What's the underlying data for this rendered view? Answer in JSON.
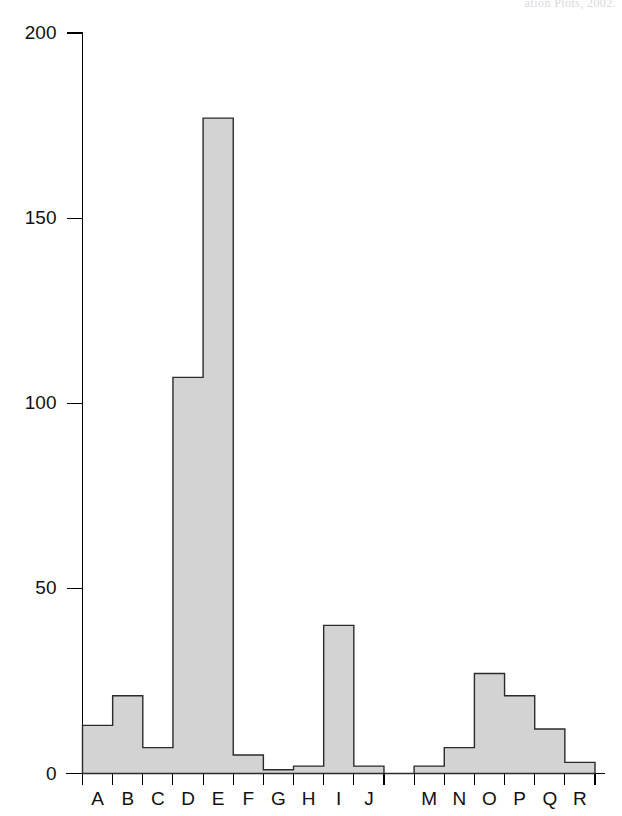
{
  "page": {
    "header_fragment": "ation Plots, 2002."
  },
  "chart_data": {
    "type": "bar",
    "title": "",
    "subtitle": "",
    "xlabel": "",
    "ylabel": "",
    "categories": [
      "A",
      "B",
      "C",
      "D",
      "E",
      "F",
      "G",
      "H",
      "I",
      "J",
      "",
      "M",
      "N",
      "O",
      "P",
      "Q",
      "R"
    ],
    "values": [
      13,
      21,
      7,
      107,
      177,
      5,
      1,
      2,
      40,
      2,
      0,
      2,
      7,
      27,
      21,
      12,
      3
    ],
    "ylim": [
      0,
      200
    ],
    "yticks": [
      0,
      50,
      100,
      150,
      200
    ],
    "ytick_labels": [
      "0",
      "50",
      "100",
      "150",
      "200"
    ],
    "xtick_labels": [
      "A",
      "B",
      "C",
      "D",
      "E",
      "F",
      "G",
      "H",
      "I",
      "J",
      "M",
      "N",
      "O",
      "P",
      "Q",
      "R"
    ],
    "grid": false,
    "legend": null,
    "bar_fill_color": "#d3d3d3",
    "bar_edge_color": "#2b2b2b",
    "axis_color": "#000000",
    "background_color": "#ffffff",
    "note": "Contiguous histogram-style bars; the bin between J and M is empty (value 0)."
  }
}
